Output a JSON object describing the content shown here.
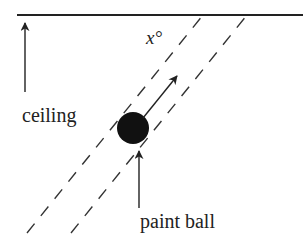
{
  "diagram": {
    "labels": {
      "angle": "x°",
      "angle_var": "x",
      "angle_unit": "°",
      "ceiling": "ceiling",
      "paint_ball": "paint ball"
    },
    "colors": {
      "ink": "#222222",
      "background": "#ffffff"
    },
    "elements": {
      "ceiling_line": "solid horizontal line",
      "trajectory_bounds": "two parallel dashed lines",
      "ball": "filled black circle",
      "velocity_arrow": "arrow from ball along trajectory",
      "ceiling_pointer": "arrow pointing up to ceiling",
      "ball_pointer": "arrow pointing up to ball"
    }
  }
}
